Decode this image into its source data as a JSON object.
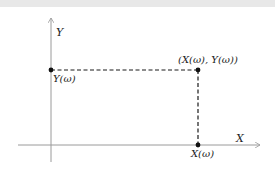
{
  "diagram": {
    "title": "",
    "axes": {
      "x_label": "X",
      "y_label": "Y"
    },
    "points": {
      "pair": "(X(ω), Y(ω))",
      "y_projection": "Y(ω)",
      "x_projection": "X(ω)"
    },
    "colors": {
      "axis": "#9a9a9a",
      "dashed": "#1a1a1a",
      "point": "#111111",
      "top_band": "#e8e8e8"
    }
  }
}
